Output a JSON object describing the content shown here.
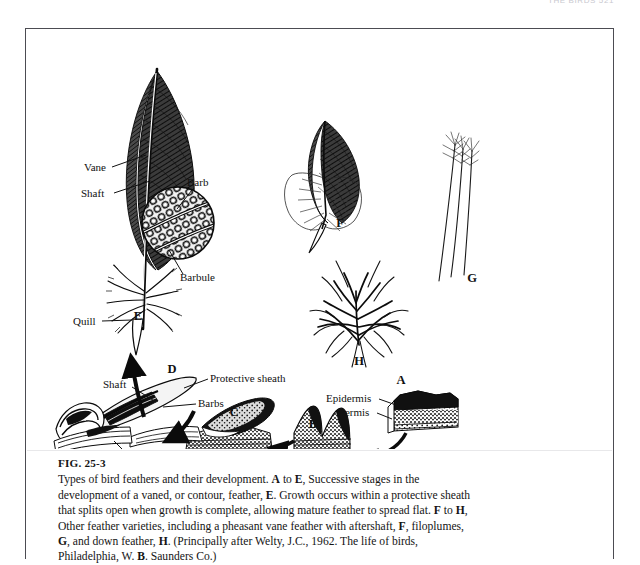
{
  "page": {
    "running_head": "THE BIRDS  521",
    "background": "#ffffff",
    "ink": "#111111"
  },
  "figure": {
    "number": "FIG. 25-3",
    "caption_lines": [
      "Types of bird feathers and their development. A to E, Successive stages in the",
      "development of a vaned, or contour, feather, E. Growth occurs within a protective sheath",
      "that splits open when growth is complete, allowing mature feather to spread flat. F to H,",
      "Other feather varieties, including a pheasant vane feather with aftershaft, F, filoplumes,",
      "G, and down feather, H. (Principally after Welty, J.C., 1962. The life of birds,",
      "Philadelphia, W. B. Saunders Co.)"
    ],
    "source": {
      "author": "Welty, J.C.",
      "year": "1962",
      "title": "The life of birds",
      "publisher": "W. B. Saunders Co.",
      "city": "Philadelphia"
    }
  },
  "chart_data": {
    "type": "diagram",
    "title": "Types of bird feathers and their development",
    "panels": [
      {
        "key": "A",
        "label": "A",
        "description": "Skin cross-section with epidermis and dermis",
        "x": 375,
        "y": 352
      },
      {
        "key": "B",
        "label": "B",
        "description": "Feather papilla rising from skin",
        "x": 287,
        "y": 397
      },
      {
        "key": "C",
        "label": "C",
        "description": "Elongating feather germ on skin",
        "x": 208,
        "y": 386
      },
      {
        "key": "D",
        "label": "D",
        "description": "Developing feather within protective sheath in follicle",
        "x": 146,
        "y": 341
      },
      {
        "key": "E",
        "label": "E",
        "description": "Mature vaned contour feather",
        "x": 112,
        "y": 287
      },
      {
        "key": "F",
        "label": "F",
        "description": "Pheasant vane feather with aftershaft",
        "x": 313,
        "y": 196
      },
      {
        "key": "G",
        "label": "G",
        "description": "Filoplumes",
        "x": 444,
        "y": 249
      },
      {
        "key": "H",
        "label": "H",
        "description": "Down feather",
        "x": 333,
        "y": 330
      }
    ],
    "callouts": [
      {
        "text": "Vane",
        "x": 58,
        "y": 142,
        "anchor": "start",
        "leader": [
          [
            84,
            139
          ],
          [
            118,
            125
          ]
        ]
      },
      {
        "text": "Shaft",
        "x": 55,
        "y": 168,
        "anchor": "start",
        "leader": [
          [
            86,
            165
          ],
          [
            122,
            153
          ]
        ]
      },
      {
        "text": "Barb",
        "x": 163,
        "y": 158,
        "anchor": "start",
        "leader": [
          [
            166,
            162
          ],
          [
            150,
            179
          ]
        ]
      },
      {
        "text": "Barbule",
        "x": 155,
        "y": 251,
        "anchor": "start",
        "leader": [
          [
            158,
            246
          ],
          [
            143,
            222
          ]
        ]
      },
      {
        "text": "Quill",
        "x": 47,
        "y": 296,
        "anchor": "start",
        "leader": [
          [
            74,
            292
          ],
          [
            104,
            290
          ]
        ]
      },
      {
        "text": "Shaft",
        "x": 77,
        "y": 358,
        "anchor": "start",
        "leader": [
          [
            104,
            358
          ],
          [
            128,
            372
          ]
        ]
      },
      {
        "text": "Protective sheath",
        "x": 183,
        "y": 352,
        "anchor": "start",
        "leader": [
          [
            181,
            350
          ],
          [
            158,
            358
          ]
        ]
      },
      {
        "text": "Barbs",
        "x": 170,
        "y": 377,
        "anchor": "start",
        "leader": [
          [
            168,
            374
          ],
          [
            138,
            379
          ]
        ]
      },
      {
        "text": "Follicle",
        "x": 108,
        "y": 435,
        "anchor": "start",
        "leader": [
          [
            107,
            431
          ],
          [
            90,
            412
          ]
        ]
      },
      {
        "text": "Epidermis",
        "x": 300,
        "y": 373,
        "anchor": "start",
        "leader": [
          [
            352,
            370
          ],
          [
            370,
            376
          ]
        ]
      },
      {
        "text": "Dermis",
        "x": 310,
        "y": 386,
        "anchor": "start",
        "leader": [
          [
            352,
            384
          ],
          [
            368,
            392
          ]
        ]
      }
    ],
    "arrows": [
      {
        "from": "A",
        "to": "B",
        "description": "A to B, curving left"
      },
      {
        "from": "B",
        "to": "C",
        "description": "B to C, curving left"
      },
      {
        "from": "C",
        "to": "D",
        "description": "C to D, curving left"
      },
      {
        "from": "D",
        "to": "E",
        "description": "D to E, curving up"
      }
    ],
    "legend": "A-E successive developmental stages; F-H other feather varieties"
  }
}
